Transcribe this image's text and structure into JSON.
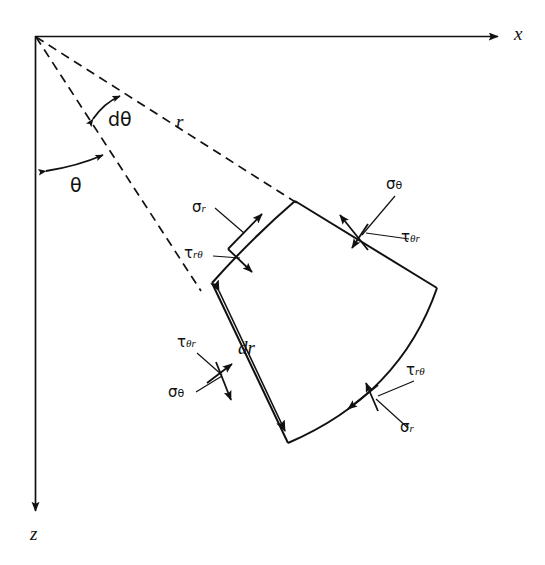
{
  "figure": {
    "background_color": "#ffffff",
    "line_color": "#111111"
  },
  "axes": [
    {
      "name": "x-axis",
      "label": "x",
      "direction": "right",
      "start": [
        35,
        36
      ],
      "end": [
        502,
        37
      ],
      "label_pos": [
        514,
        24
      ]
    },
    {
      "name": "z-axis",
      "label": "z",
      "direction": "down",
      "start": [
        35,
        36
      ],
      "end": [
        36,
        515
      ],
      "label_pos": [
        30,
        524
      ]
    }
  ],
  "rays": [
    {
      "name": "radius-ray-upper",
      "style": "dashed",
      "label": "r",
      "from": [
        35,
        36
      ],
      "to": [
        300,
        205
      ],
      "label_pos": [
        176,
        112
      ]
    },
    {
      "name": "radius-ray-lower",
      "style": "dashed",
      "label": "",
      "from": [
        35,
        36
      ],
      "to": [
        200,
        290
      ],
      "label_pos": [
        0,
        0
      ]
    }
  ],
  "angles": [
    {
      "name": "theta-arc",
      "label": "θ",
      "label_pos": [
        70,
        176
      ],
      "between": [
        "z-axis",
        "radius-ray-lower"
      ],
      "arrows": "double"
    },
    {
      "name": "dtheta-arc",
      "label": "dθ",
      "label_pos": [
        108,
        110
      ],
      "between": [
        "radius-ray-lower",
        "radius-ray-upper"
      ],
      "arrows": "double"
    }
  ],
  "dimensions": [
    {
      "name": "dr-dimension",
      "label": "dr",
      "label_pos": [
        238,
        338
      ],
      "from": [
        216,
        287
      ],
      "to": [
        290,
        438
      ],
      "arrows": "double"
    }
  ],
  "element": {
    "name": "stress-element",
    "shape": "curved-annular-sector",
    "corners": {
      "top": [
        295,
        201
      ],
      "right": [
        437,
        288
      ],
      "bottom": [
        288,
        443
      ],
      "left": [
        212,
        283
      ]
    }
  },
  "stress_labels": [
    {
      "id": "sigma-r-top-left",
      "base": "σ",
      "sub": "r",
      "sub_italic": true,
      "x": 192,
      "y": 200,
      "face": "inner-radial-top",
      "type": "normal"
    },
    {
      "id": "tau-r-theta-top-left",
      "base": "τ",
      "sub": "rθ",
      "sub_italic": true,
      "x": 184,
      "y": 246,
      "face": "inner-radial-top",
      "type": "shear"
    },
    {
      "id": "sigma-theta-top-right",
      "base": "σ",
      "sub": "θ",
      "sub_italic": false,
      "x": 386,
      "y": 177,
      "face": "upper-tangential",
      "type": "normal"
    },
    {
      "id": "tau-theta-r-top-right",
      "base": "τ",
      "sub": "θr",
      "sub_italic": true,
      "x": 401,
      "y": 230,
      "face": "upper-tangential",
      "type": "shear"
    },
    {
      "id": "tau-theta-r-bottom-left",
      "base": "τ",
      "sub": "θr",
      "sub_italic": true,
      "x": 177,
      "y": 335,
      "face": "lower-tangential",
      "type": "shear"
    },
    {
      "id": "sigma-theta-bottom-left",
      "base": "σ",
      "sub": "θ",
      "sub_italic": false,
      "x": 168,
      "y": 385,
      "face": "lower-tangential",
      "type": "normal"
    },
    {
      "id": "tau-r-theta-bottom-right",
      "base": "τ",
      "sub": "rθ",
      "sub_italic": true,
      "x": 406,
      "y": 363,
      "face": "outer-radial",
      "type": "shear"
    },
    {
      "id": "sigma-r-bottom-right",
      "base": "σ",
      "sub": "r",
      "sub_italic": true,
      "x": 400,
      "y": 420,
      "face": "outer-radial",
      "type": "normal"
    }
  ]
}
